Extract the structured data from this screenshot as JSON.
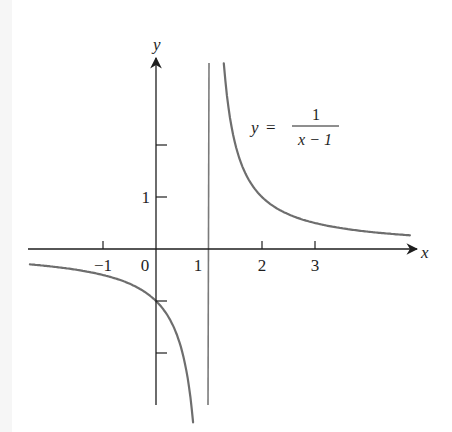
{
  "chart_data": {
    "type": "line",
    "title": "",
    "equation": {
      "lhs": "y",
      "equals": "=",
      "numerator": "1",
      "denominator": "x − 1"
    },
    "xlabel": "x",
    "ylabel": "y",
    "x_ticks": [
      -1,
      0,
      1,
      2,
      3
    ],
    "x_tick_labels": [
      "−1",
      "0",
      "1",
      "2",
      "3"
    ],
    "y_ticks": [
      -2,
      -1,
      1,
      2
    ],
    "y_tick_labels": [
      "",
      "",
      "1",
      ""
    ],
    "xlim": [
      -2.4,
      5.1
    ],
    "ylim": [
      -3.0,
      3.6
    ],
    "grid": false,
    "legend": null,
    "vertical_asymptote": 1,
    "series": [
      {
        "name": "y = 1/(x − 1), left branch",
        "x": [
          -2.38,
          -2,
          -1.5,
          -1,
          -0.5,
          0,
          0.25,
          0.5,
          0.6,
          0.7
        ],
        "y": [
          -0.296,
          -0.333,
          -0.4,
          -0.5,
          -0.667,
          -1,
          -1.333,
          -2,
          -2.5,
          -3.0
        ]
      },
      {
        "name": "y = 1/(x − 1), right branch",
        "x": [
          1.28,
          1.4,
          1.5,
          1.75,
          2,
          2.5,
          3,
          3.5,
          4,
          4.79
        ],
        "y": [
          3.57,
          2.5,
          2,
          1.333,
          1,
          0.667,
          0.5,
          0.4,
          0.333,
          0.264
        ]
      }
    ],
    "colors": {
      "axes": "#1e1e1e",
      "curve": "#6e6e6e",
      "asymptote": "#7a7a7a",
      "background": "#ffffff"
    }
  }
}
